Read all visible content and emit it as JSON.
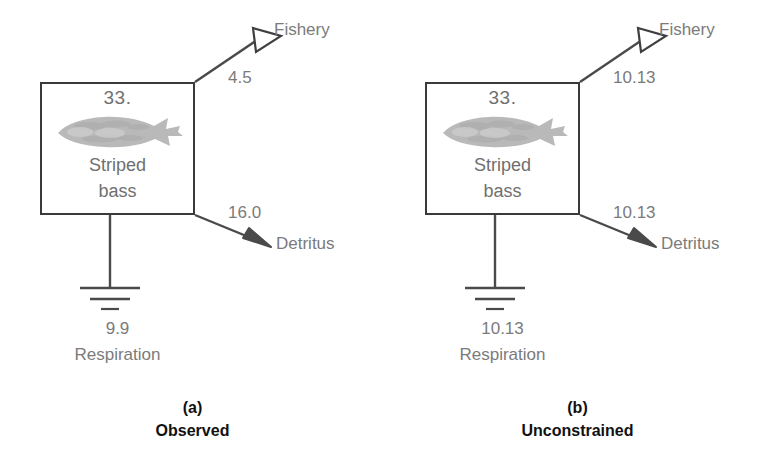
{
  "figure": {
    "type": "ecological-flow-network",
    "colors": {
      "background": "#ffffff",
      "box_border": "#3a3a3a",
      "flow_line": "#4a4a4a",
      "label_text": "#7b7b7b",
      "caption_text": "#111111",
      "fish_silhouette": "#b9b9b9"
    }
  },
  "panels": [
    {
      "id": "a",
      "caption_letter": "(a)",
      "caption_label": "Observed",
      "compartment": {
        "biomass": "33.",
        "name_line1": "Striped",
        "name_line2": "bass",
        "icon": "striped-bass-silhouette"
      },
      "flows": [
        {
          "id": "fishery",
          "target_label": "Fishery",
          "value": "4.5",
          "arrow_style": "hollow",
          "direction": "up-right"
        },
        {
          "id": "detritus",
          "target_label": "Detritus",
          "value": "16.0",
          "arrow_style": "filled",
          "direction": "down-right"
        },
        {
          "id": "respiration",
          "target_label": "Respiration",
          "value": "9.9",
          "arrow_style": "ground-symbol",
          "direction": "down"
        }
      ]
    },
    {
      "id": "b",
      "caption_letter": "(b)",
      "caption_label": "Unconstrained",
      "compartment": {
        "biomass": "33.",
        "name_line1": "Striped",
        "name_line2": "bass",
        "icon": "striped-bass-silhouette"
      },
      "flows": [
        {
          "id": "fishery",
          "target_label": "Fishery",
          "value": "10.13",
          "arrow_style": "hollow",
          "direction": "up-right"
        },
        {
          "id": "detritus",
          "target_label": "Detritus",
          "value": "10.13",
          "arrow_style": "filled",
          "direction": "down-right"
        },
        {
          "id": "respiration",
          "target_label": "Respiration",
          "value": "10.13",
          "arrow_style": "ground-symbol",
          "direction": "down"
        }
      ]
    }
  ]
}
